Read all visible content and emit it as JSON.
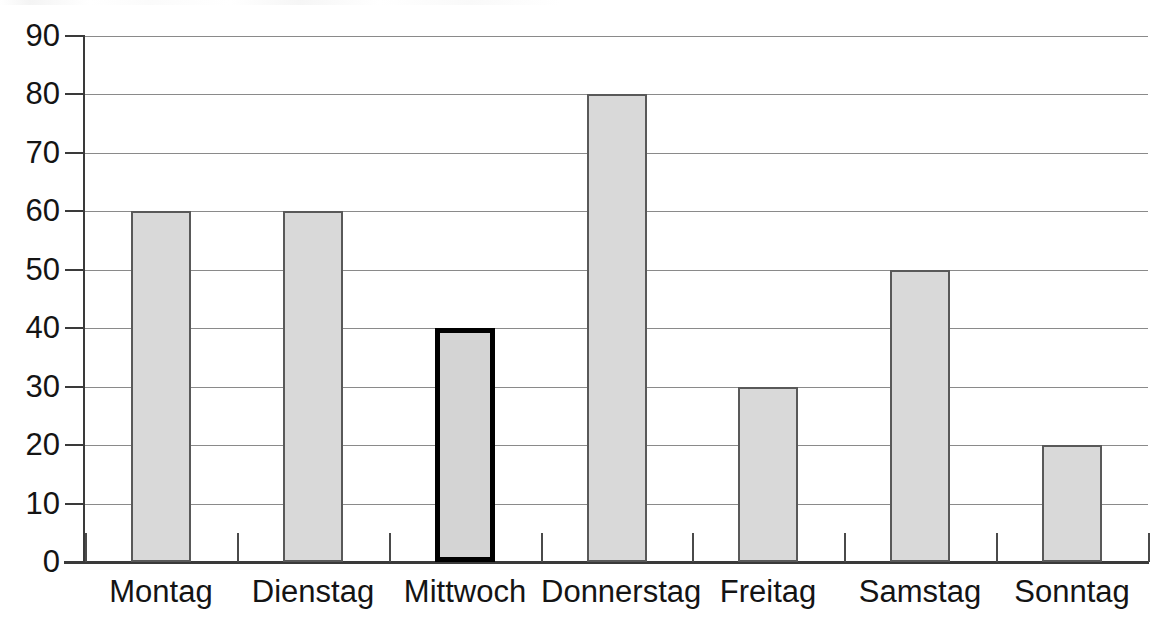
{
  "chart_data": {
    "type": "bar",
    "title": "",
    "subtitle": "",
    "xlabel": "",
    "ylabel": "",
    "categories": [
      "Montag",
      "Dienstag",
      "Mittwoch",
      "Donnerstag",
      "Freitag",
      "Samstag",
      "Sonntag"
    ],
    "values": [
      60,
      60,
      40,
      80,
      30,
      50,
      20
    ],
    "highlighted_category": "Mittwoch",
    "highlighted_index": 2,
    "ylim": [
      0,
      90
    ],
    "ytick_step": 10,
    "ytick_labels": [
      "90",
      "80",
      "70",
      "60",
      "50",
      "40",
      "30",
      "20",
      "10",
      "0"
    ],
    "ytick_values": [
      90,
      80,
      70,
      60,
      50,
      40,
      30,
      20,
      10,
      0
    ],
    "grid": "horizontal",
    "legend": "none",
    "annotations": [],
    "colors": {
      "bar_fill": "#d9d9d9",
      "bar_border": "#595959",
      "highlight_border": "#000000",
      "gridline": "#8a8a8a",
      "axis": "#3a3a3a",
      "text": "#141414",
      "background": "#ffffff"
    }
  }
}
